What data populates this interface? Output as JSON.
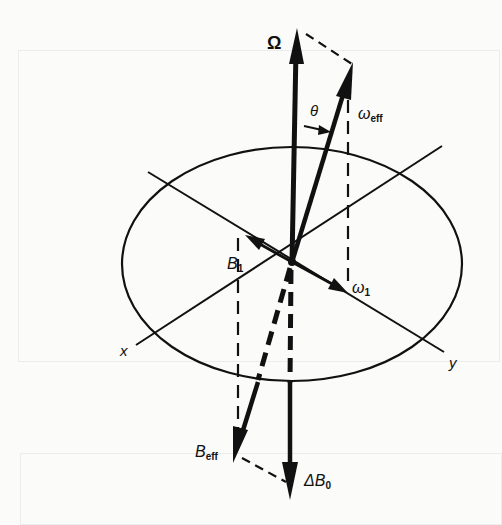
{
  "figure": {
    "colors": {
      "ink": "#111111",
      "paper": "#fbfbfa",
      "faint_frame": "#ececea"
    },
    "origin": {
      "x": 292,
      "y": 262
    },
    "plane_ellipse": {
      "cx": 292,
      "cy": 264,
      "rx": 170,
      "ry": 117
    },
    "axes": [
      {
        "name": "x",
        "label": "x",
        "from": [
          136,
          345
        ],
        "to": [
          442,
          146
        ]
      },
      {
        "name": "y",
        "label": "y",
        "from": [
          148,
          172
        ],
        "to": [
          444,
          352
        ]
      }
    ],
    "vectors": [
      {
        "id": "Omega",
        "label": "Ω",
        "from": [
          292,
          262
        ],
        "to": [
          297,
          30
        ],
        "style": "solid-thick"
      },
      {
        "id": "omega_eff",
        "label_main": "ω",
        "label_sub": "eff",
        "from": [
          292,
          262
        ],
        "to": [
          353,
          63
        ],
        "style": "solid-thick"
      },
      {
        "id": "B1",
        "label_main": "B",
        "label_sub": "1",
        "from": [
          292,
          262
        ],
        "to": [
          245,
          235
        ],
        "style": "solid"
      },
      {
        "id": "omega1",
        "label_main": "ω",
        "label_sub": "1",
        "from": [
          292,
          262
        ],
        "to": [
          347,
          292
        ],
        "style": "solid"
      },
      {
        "id": "B_eff",
        "label_main": "B",
        "label_sub": "eff",
        "from": [
          292,
          262
        ],
        "to": [
          233,
          462
        ],
        "style": "dashed-then-solid",
        "break_y": 380
      },
      {
        "id": "DeltaB0",
        "label_main": "ΔB",
        "label_sub": "0",
        "from": [
          292,
          262
        ],
        "to": [
          290,
          500
        ],
        "style": "dashed-then-solid",
        "break_y": 383
      }
    ],
    "angle": {
      "label": "θ",
      "between": [
        "Omega",
        "omega_eff"
      ]
    },
    "labels": {
      "omega": "Ω",
      "theta": "θ",
      "omega_eff_main": "ω",
      "omega_eff_sub": "eff",
      "b1_main": "B",
      "b1_sub": "1",
      "omega1_main": "ω",
      "omega1_sub": "1",
      "x_axis": "x",
      "y_axis": "y",
      "beff_main": "B",
      "beff_sub": "eff",
      "deltab0_main": "ΔB",
      "deltab0_sub": "0"
    }
  }
}
